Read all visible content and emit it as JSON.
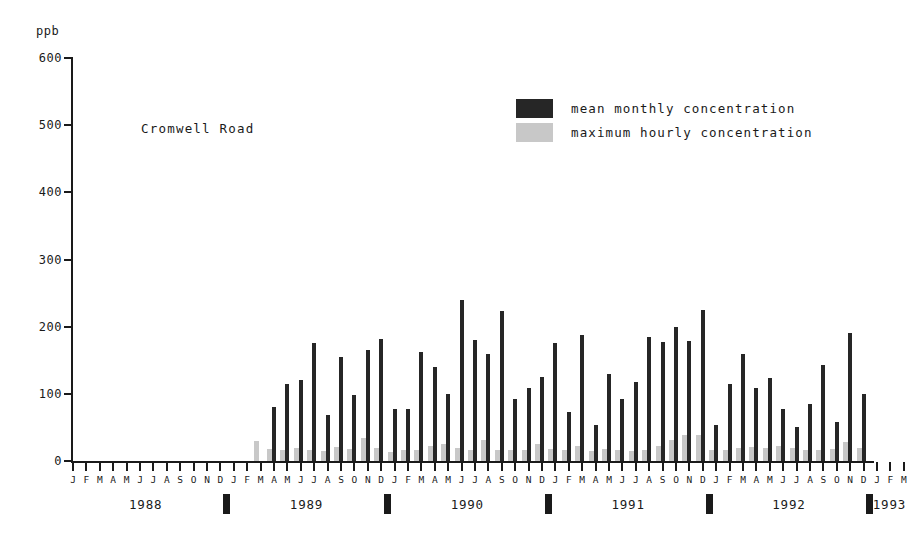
{
  "chart_data": {
    "type": "bar",
    "title": "Cromwell Road",
    "ylabel": "ppb",
    "xlabel": "",
    "ylim": [
      0,
      600
    ],
    "yticks": [
      0,
      100,
      200,
      300,
      400,
      500,
      600
    ],
    "grid": false,
    "legend_position": "top-right",
    "colors": {
      "mean_monthly": "#262626",
      "maximum_hourly": "#c8c8c8",
      "axis": "#1a1a1a",
      "background": "#ffffff"
    },
    "month_ticks": [
      "J",
      "F",
      "M",
      "A",
      "M",
      "J",
      "J",
      "A",
      "S",
      "O",
      "N",
      "D"
    ],
    "years": [
      "1988",
      "1989",
      "1990",
      "1991",
      "1992",
      "1993"
    ],
    "x": [
      "1988-J",
      "1988-F",
      "1988-M",
      "1988-A",
      "1988-M",
      "1988-J",
      "1988-J",
      "1988-A",
      "1988-S",
      "1988-O",
      "1988-N",
      "1988-D",
      "1989-J",
      "1989-F",
      "1989-M",
      "1989-A",
      "1989-M",
      "1989-J",
      "1989-J",
      "1989-A",
      "1989-S",
      "1989-O",
      "1989-N",
      "1989-D",
      "1990-J",
      "1990-F",
      "1990-M",
      "1990-A",
      "1990-M",
      "1990-J",
      "1990-J",
      "1990-A",
      "1990-S",
      "1990-O",
      "1990-N",
      "1990-D",
      "1991-J",
      "1991-F",
      "1991-M",
      "1991-A",
      "1991-M",
      "1991-J",
      "1991-J",
      "1991-A",
      "1991-S",
      "1991-O",
      "1991-N",
      "1991-D",
      "1992-J",
      "1992-F",
      "1992-M",
      "1992-A",
      "1992-M",
      "1992-J",
      "1992-J",
      "1992-A",
      "1992-S",
      "1992-O",
      "1992-N",
      "1992-D",
      "1993-J",
      "1993-F",
      "1993-M"
    ],
    "series": [
      {
        "name": "mean monthly concentration",
        "color": "#262626",
        "values": [
          null,
          null,
          null,
          null,
          null,
          null,
          null,
          null,
          null,
          null,
          null,
          null,
          null,
          null,
          null,
          80,
          115,
          120,
          175,
          68,
          155,
          98,
          165,
          182,
          78,
          78,
          163,
          140,
          100,
          240,
          180,
          160,
          223,
          92,
          108,
          125,
          175,
          73,
          188,
          53,
          130,
          93,
          118,
          185,
          177,
          200,
          178,
          225,
          53,
          115,
          160,
          108,
          123,
          78,
          50,
          85,
          143,
          58,
          190,
          100,
          null,
          null,
          null
        ]
      },
      {
        "name": "maximum hourly concentration",
        "color": "#c8c8c8",
        "values": [
          null,
          null,
          null,
          null,
          null,
          null,
          null,
          null,
          null,
          null,
          null,
          null,
          null,
          null,
          30,
          18,
          17,
          20,
          16,
          15,
          21,
          18,
          34,
          20,
          14,
          16,
          17,
          22,
          26,
          20,
          16,
          31,
          17,
          16,
          17,
          25,
          18,
          17,
          22,
          15,
          18,
          16,
          15,
          17,
          22,
          31,
          38,
          39,
          17,
          17,
          20,
          21,
          20,
          23,
          20,
          16,
          17,
          18,
          28,
          20,
          null,
          null,
          null
        ]
      }
    ]
  },
  "legend": {
    "items": [
      {
        "label": "mean monthly concentration",
        "swatch": "dark"
      },
      {
        "label": "maximum hourly concentration",
        "swatch": "light"
      }
    ]
  },
  "axis": {
    "unit": "ppb"
  }
}
